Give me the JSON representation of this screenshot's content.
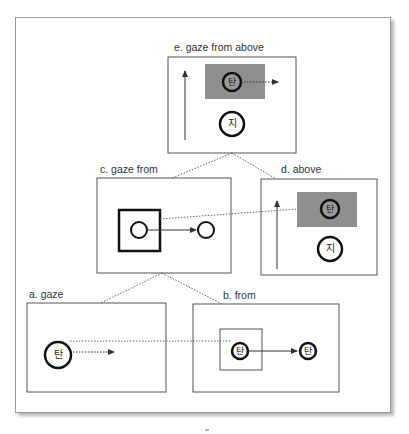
{
  "diagram": {
    "colors": {
      "box_border": "#555555",
      "thick_border": "#111111",
      "shaded_region": "#8f8f8f",
      "dotted_line": "#666666",
      "frame_border": "#9a9a9a"
    },
    "panels": {
      "e": {
        "label": "e. gaze from above",
        "target_glyph": "탄",
        "ground_glyph": "지"
      },
      "c": {
        "label": "c. gaze from"
      },
      "d": {
        "label": "d. above",
        "target_glyph": "탄",
        "ground_glyph": "지"
      },
      "a": {
        "label": "a. gaze",
        "target_glyph": "탄"
      },
      "b": {
        "label": "b. from",
        "source_glyph": "탄",
        "target_glyph": "탄"
      }
    },
    "hierarchy": [
      {
        "parent": "e",
        "children": [
          "c",
          "d"
        ]
      },
      {
        "parent": "c",
        "children": [
          "a",
          "b"
        ]
      }
    ],
    "icons": {
      "up_arrow": "arrow-up-icon",
      "dashed_arrow": "dotted-arrow-right-icon",
      "solid_arrow": "arrow-right-icon"
    }
  }
}
